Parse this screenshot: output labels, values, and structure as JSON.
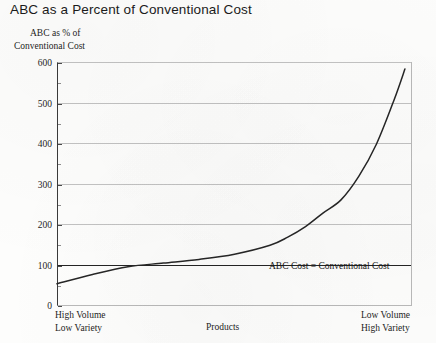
{
  "chart_data": {
    "type": "line",
    "title": "ABC as a Percent of Conventional Cost",
    "ylabel_line1": "ABC as % of",
    "ylabel_line2": "Conventional Cost",
    "xlabel": "Products",
    "x_left_label_line1": "High Volume",
    "x_left_label_line2": "Low Variety",
    "x_right_label_line1": "Low Volume",
    "x_right_label_line2": "High Variety",
    "ylim": [
      0,
      600
    ],
    "ytick_labels": [
      "0",
      "100",
      "200",
      "300",
      "400",
      "500",
      "600"
    ],
    "ytick_values": [
      0,
      100,
      200,
      300,
      400,
      500,
      600
    ],
    "grid": true,
    "reference_line": {
      "value": 100,
      "label": "ABC Cost = Conventional Cost",
      "style": "bold-solid"
    },
    "legend": "none",
    "series": [
      {
        "name": "ABC as % of Conventional Cost",
        "x": [
          0,
          10,
          20,
          30,
          40,
          50,
          60,
          65,
          70,
          75,
          80,
          85,
          90,
          95,
          98
        ],
        "values": [
          55,
          78,
          97,
          106,
          115,
          128,
          150,
          170,
          196,
          230,
          262,
          320,
          400,
          510,
          585
        ]
      }
    ],
    "colors": {
      "curve": "#262626",
      "gridline": "#c2c2c2",
      "reference_line": "#242424",
      "axis": "#3a3a3a",
      "text": "#1d1d1d",
      "background": "#fdfdfc"
    }
  }
}
